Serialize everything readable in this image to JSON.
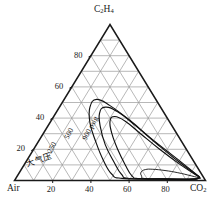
{
  "figure": {
    "kind": "ternary-flammability-diagram",
    "apex_label_main": "C",
    "apex_label_sub1": "2",
    "apex_label_mid": "H",
    "apex_label_sub2": "4",
    "left_corner": "Air",
    "right_corner_main": "CO",
    "right_corner_sub": "2",
    "grid_divisions": 10,
    "grid_color": "#9a9a9a",
    "outline_color": "#1a1a1a",
    "curve_color": "#111111"
  },
  "axes": {
    "bottom_ticks": [
      "20",
      "40",
      "60",
      "80"
    ],
    "left_ticks": [
      "20",
      "40",
      "60",
      "80"
    ],
    "bottom_tick_values": [
      20,
      40,
      60,
      80
    ],
    "left_tick_values": [
      20,
      40,
      60,
      80
    ]
  },
  "curve_labels": [
    {
      "id": "atm",
      "text": "大气压",
      "rotate": -18,
      "x": 26,
      "y": 157,
      "script": "cjk"
    },
    {
      "id": "p250",
      "text": "250",
      "rotate": -62,
      "x": 49,
      "y": 148,
      "script": "latin"
    },
    {
      "id": "p500",
      "text": "500",
      "rotate": -62,
      "x": 66,
      "y": 134,
      "script": "latin"
    },
    {
      "id": "p900",
      "text": "900 psig",
      "rotate": -62,
      "x": 84,
      "y": 135,
      "script": "latin"
    }
  ],
  "chart_data": {
    "type": "line",
    "title": "",
    "xlabel": "",
    "ylabel": "",
    "ternary_corners": {
      "top": "C2H4",
      "left": "Air",
      "right": "CO2"
    },
    "axis_range": [
      0,
      100
    ],
    "grid": true,
    "legend": "inline-curve-labels",
    "series": [
      {
        "name": "大气压",
        "pressure_psig": 0,
        "points_air_c2h4": [
          [
            2,
            1.5
          ],
          [
            6,
            3.0
          ],
          [
            12,
            5.0
          ],
          [
            18,
            6.4
          ],
          [
            24,
            7.2
          ],
          [
            28,
            7.0
          ],
          [
            31,
            5.4
          ],
          [
            32,
            3.0
          ],
          [
            31,
            1.2
          ],
          [
            20,
            0.8
          ],
          [
            8,
            0.6
          ],
          [
            2,
            1.5
          ]
        ]
      },
      {
        "name": "250",
        "pressure_psig": 250,
        "points_air_c2h4": [
          [
            2,
            2.0
          ],
          [
            8,
            10
          ],
          [
            14,
            20
          ],
          [
            19,
            30
          ],
          [
            23,
            38
          ],
          [
            27,
            41
          ],
          [
            31,
            38
          ],
          [
            34,
            30
          ],
          [
            36,
            20
          ],
          [
            37,
            10
          ],
          [
            37,
            3
          ],
          [
            34,
            1.2
          ],
          [
            20,
            0.9
          ],
          [
            6,
            0.8
          ],
          [
            2,
            2.0
          ]
        ]
      },
      {
        "name": "500",
        "pressure_psig": 500,
        "points_air_c2h4": [
          [
            2,
            2.2
          ],
          [
            8,
            12
          ],
          [
            14,
            24
          ],
          [
            19,
            35
          ],
          [
            24,
            44
          ],
          [
            29,
            47
          ],
          [
            34,
            43
          ],
          [
            38,
            34
          ],
          [
            41,
            23
          ],
          [
            42,
            12
          ],
          [
            42,
            4
          ],
          [
            39,
            1.3
          ],
          [
            22,
            1.0
          ],
          [
            6,
            0.9
          ],
          [
            2,
            2.2
          ]
        ]
      },
      {
        "name": "900 psig",
        "pressure_psig": 900,
        "points_air_c2h4": [
          [
            2,
            2.5
          ],
          [
            8,
            14
          ],
          [
            15,
            27
          ],
          [
            20,
            38
          ],
          [
            26,
            48
          ],
          [
            31,
            52
          ],
          [
            37,
            47
          ],
          [
            42,
            37
          ],
          [
            45,
            25
          ],
          [
            47,
            13
          ],
          [
            47,
            4
          ],
          [
            43,
            1.4
          ],
          [
            24,
            1.1
          ],
          [
            6,
            1.0
          ],
          [
            2,
            2.5
          ]
        ]
      }
    ]
  }
}
